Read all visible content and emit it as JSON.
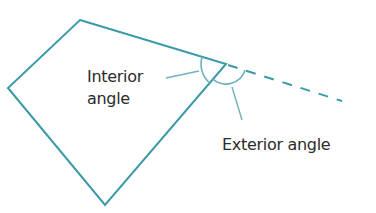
{
  "diagram": {
    "type": "polygon-angle-illustration",
    "stroke_color": "#3a9aa6",
    "leader_color": "#6fb2bb",
    "labels": {
      "interior_line1": "Interior",
      "interior_line2": "angle",
      "exterior": "Exterior angle"
    },
    "shape": "quadrilateral",
    "vertices": [
      [
        80,
        20
      ],
      [
        226,
        64
      ],
      [
        105,
        205
      ],
      [
        8,
        88
      ]
    ],
    "extension": {
      "from": [
        226,
        64
      ],
      "to": [
        342,
        101
      ],
      "style": "dashed"
    }
  }
}
